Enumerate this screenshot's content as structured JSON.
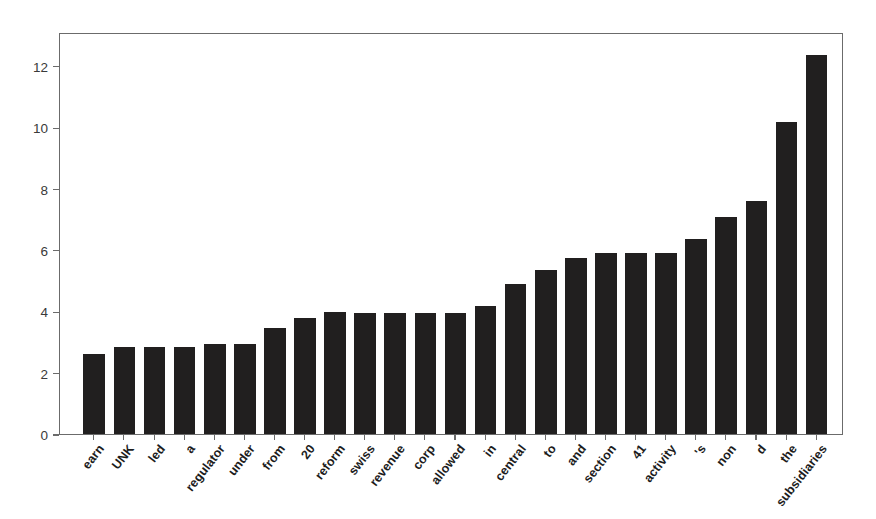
{
  "chart_data": {
    "type": "bar",
    "title": "",
    "subtitle": "",
    "xlabel": "",
    "ylabel": "",
    "ylim": [
      0,
      13.1
    ],
    "yticks": [
      0,
      2,
      4,
      6,
      8,
      10,
      12
    ],
    "ytick_labels": [
      "0",
      "2",
      "4",
      "6",
      "8",
      "10",
      "12"
    ],
    "grid": false,
    "legend": null,
    "legend_position": "none",
    "bar_color": "#211f1f",
    "axis_color": "#6b6b6b",
    "xtick_label_rotation_deg": -52,
    "categories": [
      "earn",
      "UNK",
      "led",
      "a",
      "regulator",
      "under",
      "from",
      "20",
      "reform",
      "swiss",
      "revenue",
      "corp",
      "allowed",
      "in",
      "central",
      "to",
      "and",
      "section",
      "41",
      "activity",
      "'s",
      "non",
      "d",
      "the",
      "subsidiaries"
    ],
    "values": [
      2.61,
      2.84,
      2.84,
      2.84,
      2.94,
      2.94,
      3.44,
      3.78,
      3.96,
      3.95,
      3.95,
      3.95,
      3.95,
      4.17,
      4.9,
      5.33,
      5.72,
      5.9,
      5.9,
      5.9,
      6.36,
      7.08,
      7.6,
      10.18,
      12.36
    ],
    "n_bars": 25
  }
}
